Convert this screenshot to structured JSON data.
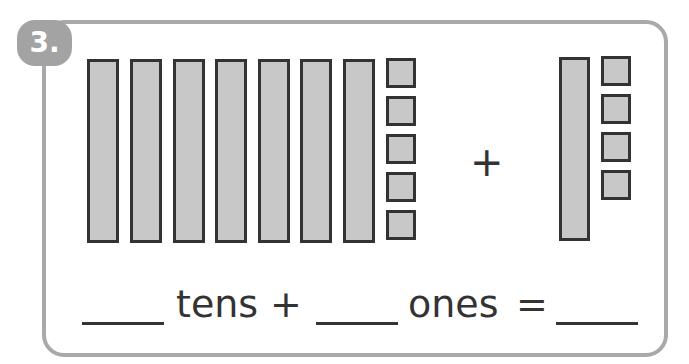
{
  "problem": {
    "number": "3.",
    "first_addend": {
      "tens": 7,
      "ones": 5
    },
    "operator": "+",
    "second_addend": {
      "tens": 1,
      "ones": 4
    }
  },
  "equation": {
    "tens_label": "tens",
    "plus": "+",
    "ones_label": "ones",
    "equals": "=",
    "blanks": [
      "",
      "",
      ""
    ]
  },
  "colors": {
    "block_fill": "#c8c8c8",
    "block_border": "#333333",
    "card_border": "#a9a9a9",
    "badge": "#a3a3a3"
  }
}
